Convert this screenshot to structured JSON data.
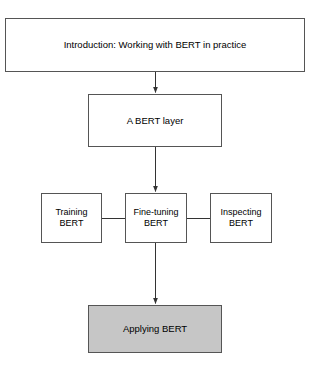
{
  "diagram": {
    "title_text": "Introduction: Working with BERT in practice",
    "background_color": "#ffffff",
    "border_color": "#555555",
    "line_color": "#333333",
    "highlight_fill": "#c6c6c6",
    "nodes": [
      {
        "id": "intro",
        "label": "Introduction: Working with BERT in practice",
        "fill": "#ffffff",
        "x": 5,
        "y": 18,
        "w": 300,
        "h": 54
      },
      {
        "id": "bert-layer",
        "label": "A BERT layer",
        "fill": "#ffffff",
        "x": 88,
        "y": 94,
        "w": 134,
        "h": 53
      },
      {
        "id": "training",
        "label": "Training\nBERT",
        "fill": "#ffffff",
        "x": 41,
        "y": 193,
        "w": 61,
        "h": 50
      },
      {
        "id": "finetuning",
        "label": "Fine-tuning\nBERT",
        "fill": "#ffffff",
        "x": 125,
        "y": 193,
        "w": 62,
        "h": 50
      },
      {
        "id": "inspecting",
        "label": "Inspecting\nBERT",
        "fill": "#ffffff",
        "x": 210,
        "y": 193,
        "w": 62,
        "h": 50
      },
      {
        "id": "applying",
        "label": "Applying BERT",
        "fill": "#c6c6c6",
        "x": 88,
        "y": 305,
        "w": 134,
        "h": 48
      }
    ],
    "edges": [
      {
        "id": "intro-to-bert-layer",
        "from": "intro",
        "to": "bert-layer",
        "kind": "arrow",
        "direction": "down"
      },
      {
        "id": "bert-layer-to-finetuning",
        "from": "bert-layer",
        "to": "finetuning",
        "kind": "arrow",
        "direction": "down"
      },
      {
        "id": "training-to-finetuning",
        "from": "training",
        "to": "finetuning",
        "kind": "line",
        "direction": "horizontal"
      },
      {
        "id": "finetuning-to-inspecting",
        "from": "finetuning",
        "to": "inspecting",
        "kind": "line",
        "direction": "horizontal"
      },
      {
        "id": "finetuning-to-applying",
        "from": "finetuning",
        "to": "applying",
        "kind": "arrow",
        "direction": "down"
      }
    ]
  }
}
